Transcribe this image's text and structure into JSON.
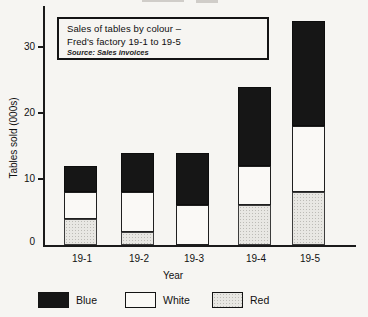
{
  "chart_data": {
    "type": "bar",
    "stacked": true,
    "title_lines": [
      "Sales of tables by colour –",
      "Fred's factory 19-1 to 19-5"
    ],
    "source_note": "Source: Sales invoices",
    "categories": [
      "19-1",
      "19-2",
      "19-3",
      "19-4",
      "19-5"
    ],
    "series": [
      {
        "name": "Red",
        "swatch": "red",
        "values": [
          4,
          2,
          0,
          6,
          8
        ]
      },
      {
        "name": "White",
        "swatch": "white",
        "values": [
          4,
          6,
          6,
          6,
          10
        ]
      },
      {
        "name": "Blue",
        "swatch": "blue",
        "values": [
          4,
          6,
          8,
          12,
          16
        ]
      }
    ],
    "totals": [
      12,
      14,
      14,
      24,
      34
    ],
    "xlabel": "Year",
    "ylabel": "Tables sold (000s)",
    "yticks": [
      0,
      10,
      20,
      30
    ],
    "ylim": [
      0,
      35
    ],
    "grid": false,
    "legend_position": "bottom",
    "legend": [
      {
        "label": "Blue",
        "swatch": "blue"
      },
      {
        "label": "White",
        "swatch": "white"
      },
      {
        "label": "Red",
        "swatch": "red"
      }
    ],
    "colors": {
      "blue": "#161616",
      "white": "#faf9f6",
      "red": "#e8e7e3",
      "axis": "#1a1a1a"
    }
  }
}
